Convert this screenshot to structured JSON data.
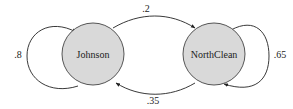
{
  "diagram": {
    "type": "markov-chain",
    "colors": {
      "node_fill": "#d9d9d9",
      "node_stroke": "#555555",
      "edge_stroke": "#222222",
      "text": "#222222"
    },
    "nodes": [
      {
        "id": "johnson",
        "label": "Johnson"
      },
      {
        "id": "northclean",
        "label": "NorthClean"
      }
    ],
    "edges": [
      {
        "from": "johnson",
        "to": "johnson",
        "label": ".8"
      },
      {
        "from": "johnson",
        "to": "northclean",
        "label": ".2"
      },
      {
        "from": "northclean",
        "to": "johnson",
        "label": ".35"
      },
      {
        "from": "northclean",
        "to": "northclean",
        "label": ".65"
      }
    ]
  }
}
